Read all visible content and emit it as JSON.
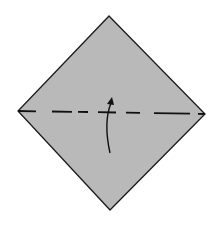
{
  "diagram": {
    "type": "origami-fold-step",
    "paper": {
      "shape": "square rotated 45 degrees (diamond)",
      "fill": "#b9b9b9",
      "stroke": "#1a1a1a",
      "vertices": {
        "top": [
          109,
          16
        ],
        "right": [
          205,
          114
        ],
        "bottom": [
          110,
          210
        ],
        "left": [
          18,
          111
        ]
      }
    },
    "fold_line": {
      "style": "dashed",
      "kind": "valley-fold",
      "from": [
        18,
        111
      ],
      "to": [
        205,
        114
      ],
      "color": "#111111"
    },
    "arrow": {
      "kind": "fold-up",
      "direction": "up",
      "color": "#111111"
    }
  }
}
